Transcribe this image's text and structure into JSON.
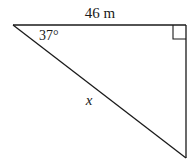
{
  "diagram": {
    "type": "right-triangle",
    "side_top_label": "46 m",
    "angle_label": "37°",
    "hypotenuse_label": "x",
    "right_angle_marker": true,
    "stroke_color": "#1a1a1a",
    "background": "#ffffff"
  }
}
